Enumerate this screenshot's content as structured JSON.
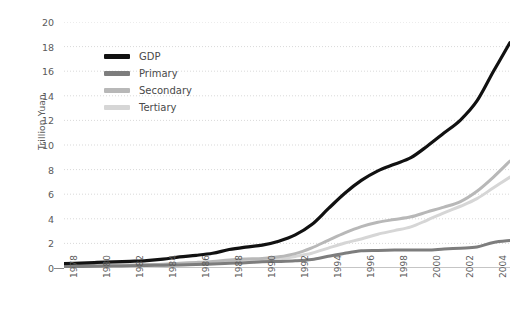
{
  "chart_data": {
    "type": "line",
    "title": "",
    "subtitle": "",
    "xlabel": "",
    "ylabel": "Trillion Yuan",
    "xlim": [
      1978,
      2005
    ],
    "ylim": [
      0,
      20
    ],
    "yticks": [
      0,
      2,
      4,
      6,
      8,
      10,
      12,
      14,
      16,
      18,
      20
    ],
    "ytick_labels": [
      "0",
      "2",
      "4",
      "6",
      "8",
      "10",
      "12",
      "14",
      "16",
      "18",
      "20"
    ],
    "xticks": [
      1978,
      1979,
      1980,
      1981,
      1982,
      1983,
      1984,
      1985,
      1986,
      1987,
      1988,
      1989,
      1990,
      1991,
      1992,
      1993,
      1994,
      1995,
      1996,
      1997,
      1998,
      1999,
      2000,
      2001,
      2002,
      2003,
      2004,
      2005
    ],
    "xtick_labels": [
      "1978",
      "1980",
      "1982",
      "1984",
      "1986",
      "1988",
      "1990",
      "1992",
      "1994",
      "1996",
      "1998",
      "2000",
      "2002",
      "2004"
    ],
    "xtick_labeled_years": [
      1978,
      1980,
      1982,
      1984,
      1986,
      1988,
      1990,
      1992,
      1994,
      1996,
      1998,
      2000,
      2002,
      2004
    ],
    "grid": true,
    "grid_axis": "y",
    "legend_position": "upper-left-inside",
    "x": [
      1978,
      1979,
      1980,
      1981,
      1982,
      1983,
      1984,
      1985,
      1986,
      1987,
      1988,
      1989,
      1990,
      1991,
      1992,
      1993,
      1994,
      1995,
      1996,
      1997,
      1998,
      1999,
      2000,
      2001,
      2002,
      2003,
      2004,
      2005
    ],
    "series": [
      {
        "name": "GDP",
        "color": "#111111",
        "values": [
          0.36,
          0.4,
          0.45,
          0.49,
          0.54,
          0.6,
          0.72,
          0.9,
          1.03,
          1.2,
          1.5,
          1.7,
          1.86,
          2.18,
          2.69,
          3.53,
          4.82,
          6.08,
          7.12,
          7.9,
          8.44,
          8.97,
          9.92,
          10.97,
          12.03,
          13.58,
          15.99,
          18.32
        ]
      },
      {
        "name": "Primary",
        "color": "#7d7d7d",
        "values": [
          0.1,
          0.12,
          0.14,
          0.16,
          0.18,
          0.2,
          0.23,
          0.25,
          0.28,
          0.32,
          0.38,
          0.42,
          0.5,
          0.53,
          0.58,
          0.69,
          0.95,
          1.2,
          1.4,
          1.43,
          1.46,
          1.47,
          1.46,
          1.54,
          1.61,
          1.7,
          2.08,
          2.23
        ]
      },
      {
        "name": "Secondary",
        "color": "#b8b8b8",
        "values": [
          0.17,
          0.19,
          0.22,
          0.24,
          0.25,
          0.28,
          0.31,
          0.39,
          0.45,
          0.53,
          0.66,
          0.73,
          0.77,
          0.91,
          1.17,
          1.64,
          2.25,
          2.85,
          3.36,
          3.72,
          3.94,
          4.16,
          4.56,
          4.95,
          5.4,
          6.24,
          7.39,
          8.7
        ]
      },
      {
        "name": "Tertiary",
        "color": "#d6d6d6",
        "values": [
          0.09,
          0.09,
          0.1,
          0.11,
          0.12,
          0.13,
          0.18,
          0.26,
          0.3,
          0.35,
          0.46,
          0.55,
          0.59,
          0.74,
          0.94,
          1.2,
          1.62,
          2.03,
          2.36,
          2.75,
          3.04,
          3.34,
          3.9,
          4.48,
          5.02,
          5.64,
          6.52,
          7.39
        ]
      }
    ]
  },
  "legend": {
    "items": [
      {
        "label": "GDP",
        "color": "#111111"
      },
      {
        "label": "Primary",
        "color": "#7d7d7d"
      },
      {
        "label": "Secondary",
        "color": "#b8b8b8"
      },
      {
        "label": "Tertiary",
        "color": "#d6d6d6"
      }
    ]
  },
  "axes": {
    "y_title": "Trillion Yuan"
  },
  "style": {
    "background": "#ffffff",
    "grid_color": "#d9d9d9",
    "axis_color": "#8a8a8a",
    "tick_text_color": "#5b5b5b"
  }
}
